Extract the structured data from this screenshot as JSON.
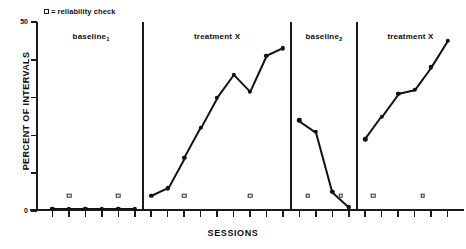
{
  "legend": {
    "marker_icon": "open-square-marker",
    "equals": "=",
    "label": "reliability check"
  },
  "axes": {
    "ylabel": "PERCENT OF INTERVALS",
    "xlabel": "SESSIONS",
    "ytick_labels": [
      "0",
      "",
      "",
      "",
      "",
      "50"
    ],
    "ytick_values": [
      0,
      10,
      20,
      30,
      40,
      50
    ],
    "ylim": [
      0,
      50
    ],
    "xlim": [
      0,
      26
    ]
  },
  "phases": [
    {
      "name": "baseline-1",
      "label": "baseline",
      "sub": "1"
    },
    {
      "name": "treatment-x-1",
      "label": "treatment X",
      "sub": ""
    },
    {
      "name": "baseline-2",
      "label": "baseline",
      "sub": "2"
    },
    {
      "name": "treatment-x-2",
      "label": "treatment X",
      "sub": ""
    }
  ],
  "chart_data": {
    "type": "line",
    "title": "",
    "subtitle": "",
    "xlabel": "SESSIONS",
    "ylabel": "PERCENT OF INTERVALS",
    "xlim": [
      0,
      26
    ],
    "ylim": [
      0,
      50
    ],
    "grid": false,
    "legend_position": "top-left",
    "legend_entries": [
      "□=reliability check"
    ],
    "annotations": [
      "baseline₁",
      "treatment X",
      "baseline₂",
      "treatment X"
    ],
    "series": [
      {
        "name": "baseline-1",
        "phase": "baseline₁",
        "x": [
          1,
          2,
          3,
          4,
          5,
          6
        ],
        "y": [
          0.6,
          0.6,
          0.6,
          0.6,
          0.6,
          0.6
        ]
      },
      {
        "name": "treatment-x-1",
        "phase": "treatment X",
        "x": [
          7,
          8,
          9,
          10,
          11,
          12,
          13,
          14,
          15
        ],
        "y": [
          4,
          6,
          14,
          22,
          30,
          36,
          31.5,
          41,
          43
        ]
      },
      {
        "name": "baseline-2",
        "phase": "baseline₂",
        "x": [
          16,
          17,
          18,
          19
        ],
        "y": [
          24,
          21,
          5,
          1
        ]
      },
      {
        "name": "treatment-x-2",
        "phase": "treatment X",
        "x": [
          20,
          21,
          22,
          23,
          24,
          25
        ],
        "y": [
          19,
          25,
          31,
          32,
          38,
          45
        ]
      }
    ],
    "reliability_checks": {
      "marker": "open square",
      "y": 4,
      "x": [
        2,
        5,
        9,
        13,
        16.5,
        18.5,
        20.5,
        23.5
      ]
    }
  }
}
